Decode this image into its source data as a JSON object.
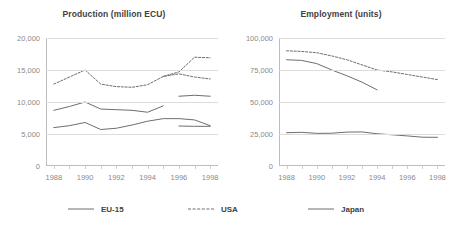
{
  "legend": {
    "items": [
      {
        "label": "EU-15",
        "style": "solid",
        "color": "#6e6e6e"
      },
      {
        "label": "USA",
        "style": "dashed",
        "color": "#6e6e6e"
      },
      {
        "label": "Japan",
        "style": "solid",
        "color": "#6e6e6e"
      }
    ]
  },
  "chart_data": [
    {
      "type": "line",
      "title": "Production (million ECU)",
      "xlabel": "",
      "ylabel": "",
      "x": [
        1988,
        1989,
        1990,
        1991,
        1992,
        1993,
        1994,
        1995,
        1996,
        1997,
        1998
      ],
      "xlim": [
        1987.5,
        1998.5
      ],
      "xticks": [
        1988,
        1990,
        1992,
        1994,
        1996,
        1998
      ],
      "xtick_labels": [
        "1988",
        "1990",
        "1992",
        "1994",
        "1996",
        "1998"
      ],
      "xminor_ticks": [
        1988,
        1989,
        1990,
        1991,
        1992,
        1993,
        1994,
        1995,
        1996,
        1997,
        1998
      ],
      "ylim": [
        0,
        20000
      ],
      "yticks": [
        0,
        5000,
        10000,
        15000,
        20000
      ],
      "ytick_labels": [
        "0",
        "5,000",
        "10,000",
        "15,000",
        "20,000"
      ],
      "grid": true,
      "legend_position": "bottom",
      "series": [
        {
          "name": "USA",
          "style": "dashed",
          "color": "#6e6e6e",
          "values": [
            12800,
            13900,
            15000,
            12800,
            12400,
            12300,
            12700,
            14000,
            14400,
            13900,
            13600
          ]
        },
        {
          "name": "EU-15",
          "style": "solid",
          "color": "#6e6e6e",
          "values": [
            8700,
            9300,
            10000,
            8900,
            8800,
            8700,
            8400,
            9400,
            null,
            null,
            null
          ]
        },
        {
          "name": "Japan",
          "style": "solid",
          "color": "#6e6e6e",
          "values": [
            6000,
            6300,
            6800,
            5700,
            5900,
            6400,
            7000,
            7400,
            7400,
            7200,
            6300
          ]
        }
      ],
      "series_extra": [
        {
          "name": "USA",
          "style": "dashed",
          "color": "#6e6e6e",
          "x": [
            1995,
            1996,
            1997,
            1998
          ],
          "values": [
            14000,
            14700,
            17000,
            16900
          ]
        },
        {
          "name": "EU-15",
          "style": "solid",
          "color": "#6e6e6e",
          "x": [
            1996,
            1997,
            1998
          ],
          "values": [
            10900,
            11050,
            10900
          ]
        },
        {
          "name": "Japan",
          "style": "solid",
          "color": "#6e6e6e",
          "x": [
            1996,
            1997,
            1998
          ],
          "values": [
            6250,
            6200,
            6200
          ]
        }
      ]
    },
    {
      "type": "line",
      "title": "Employment (units)",
      "xlabel": "",
      "ylabel": "",
      "x": [
        1988,
        1989,
        1990,
        1991,
        1992,
        1993,
        1994,
        1995,
        1996,
        1997,
        1998
      ],
      "xlim": [
        1987.5,
        1998.5
      ],
      "xticks": [
        1988,
        1990,
        1992,
        1994,
        1996,
        1998
      ],
      "xtick_labels": [
        "1988",
        "1990",
        "1992",
        "1994",
        "1996",
        "1998"
      ],
      "xminor_ticks": [
        1988,
        1989,
        1990,
        1991,
        1992,
        1993,
        1994,
        1995,
        1996,
        1997,
        1998
      ],
      "ylim": [
        0,
        100000
      ],
      "yticks": [
        0,
        25000,
        50000,
        75000,
        100000
      ],
      "ytick_labels": [
        "0",
        "25,000",
        "50,000",
        "75,000",
        "100,000"
      ],
      "grid": true,
      "legend_position": "bottom",
      "series": [
        {
          "name": "USA",
          "style": "dashed",
          "color": "#6e6e6e",
          "values": [
            90000,
            89500,
            88500,
            86000,
            83000,
            79000,
            75000,
            73500,
            71500,
            69500,
            67500
          ]
        },
        {
          "name": "EU-15",
          "style": "solid",
          "color": "#6e6e6e",
          "values": [
            83000,
            82500,
            80000,
            75000,
            70500,
            65500,
            59500,
            null,
            null,
            null,
            null
          ]
        },
        {
          "name": "Japan",
          "style": "solid",
          "color": "#6e6e6e",
          "values": [
            26000,
            26300,
            25500,
            25600,
            26500,
            26600,
            25200,
            24400,
            23500,
            22500,
            22400
          ]
        }
      ]
    }
  ]
}
